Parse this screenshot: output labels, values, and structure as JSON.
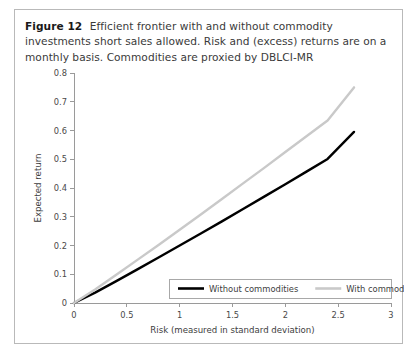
{
  "caption": {
    "label": "Figure 12",
    "text": "Efficient frontier with and without commodity investments short sales allowed. Risk and (excess) returns are on a monthly basis. Commodities are proxied by DBLCI-MR"
  },
  "colors": {
    "without_commodities": "#000000",
    "with_commodities": "#c9c9c9",
    "axis": "#9a9a9a",
    "frame_border": "#b9b9b9",
    "caption_text": "#3a3a3a"
  },
  "chart_data": {
    "type": "line",
    "title": "",
    "xlabel": "Risk (measured in standard deviation)",
    "ylabel": "Expected return",
    "xlim": [
      0,
      3
    ],
    "ylim": [
      0,
      0.8
    ],
    "xticks": [
      0,
      0.5,
      1,
      1.5,
      2,
      2.5,
      3
    ],
    "xtick_labels": [
      "0",
      "0.5",
      "1",
      "1.5",
      "2",
      "2.5",
      "3"
    ],
    "yticks": [
      0,
      0.1,
      0.2,
      0.3,
      0.4,
      0.5,
      0.6,
      0.7,
      0.8
    ],
    "ytick_labels": [
      "0",
      "0.1",
      "0.2",
      "0.3",
      "0.4",
      "0.5",
      "0.6",
      "0.7",
      "0.8"
    ],
    "grid": false,
    "legend_position": "bottom-right",
    "series": [
      {
        "name": "Without commodities",
        "color": "#000000",
        "width": 2.4,
        "x": [
          0,
          0.2,
          0.4,
          0.6,
          0.8,
          1.0,
          1.2,
          1.4,
          1.6,
          1.8,
          2.0,
          2.2,
          2.4,
          2.65
        ],
        "y": [
          0,
          0.036,
          0.076,
          0.117,
          0.158,
          0.2,
          0.242,
          0.284,
          0.327,
          0.37,
          0.413,
          0.457,
          0.501,
          0.595
        ]
      },
      {
        "name": "With commodities",
        "color": "#c9c9c9",
        "width": 2.4,
        "x": [
          0,
          0.2,
          0.4,
          0.6,
          0.8,
          1.0,
          1.2,
          1.4,
          1.6,
          1.8,
          2.0,
          2.2,
          2.4,
          2.65
        ],
        "y": [
          0,
          0.047,
          0.098,
          0.15,
          0.202,
          0.255,
          0.308,
          0.362,
          0.416,
          0.47,
          0.525,
          0.58,
          0.635,
          0.75
        ]
      }
    ]
  },
  "legend": {
    "items": [
      {
        "label": "Without commodities",
        "color": "#000000"
      },
      {
        "label": "With commodities",
        "color": "#c9c9c9"
      }
    ]
  }
}
